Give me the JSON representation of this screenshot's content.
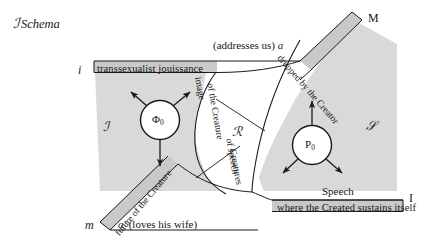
{
  "figure": {
    "title_script": "ℐ",
    "title_text": "Schema",
    "background_color": "#ffffff",
    "band_fill_color": "#c9c9c9",
    "region_fill_color": "#d9d9d9",
    "line_color": "#1a1a1a"
  },
  "endpoints": [
    {
      "id": "i",
      "label": "i",
      "position": "upper-left"
    },
    {
      "id": "m",
      "label": "m",
      "position": "lower-left"
    },
    {
      "id": "M",
      "label": "M",
      "position": "upper-right"
    },
    {
      "id": "I",
      "label": "I",
      "position": "lower-right"
    }
  ],
  "bands": {
    "top_left": {
      "label": "transsexualist jouissance"
    },
    "top_right": {
      "label": "dropped by the Creator",
      "orientation": "diagonal"
    },
    "bottom_left": {
      "label": "future of the Creature",
      "orientation": "diagonal"
    },
    "bottom_right": {
      "label": "where the Created sustains itself"
    }
  },
  "annotations": {
    "addresses": "(addresses us) ",
    "addresses_italic": "a",
    "speech": "Speech",
    "loves_wife_italic": "a′",
    "loves_wife": " (loves his wife)",
    "image_of_creature_line1": "image",
    "image_of_creature_line2": "of the Creature",
    "creatures_of_speech_line1": "Creatures",
    "creatures_of_speech_line2": "of speech"
  },
  "symbols": {
    "imaginary": "ℐ",
    "real": "ℛ",
    "symbolic": "ℳ",
    "symbolic_display": "𝒮"
  },
  "nodes": [
    {
      "id": "phi",
      "glyph": "Φ",
      "subscript": "0",
      "arrows": [
        "up-left",
        "up-right",
        "down"
      ]
    },
    {
      "id": "p",
      "glyph": "P",
      "subscript": "0",
      "arrows": [
        "up",
        "down-left",
        "down-right"
      ]
    }
  ]
}
